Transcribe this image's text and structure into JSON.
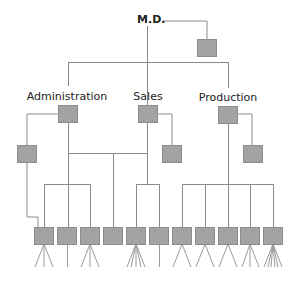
{
  "diagram": {
    "title_node": {
      "label": "M.D."
    },
    "departments": [
      {
        "label": "Administration"
      },
      {
        "label": "Sales"
      },
      {
        "label": "Production"
      }
    ],
    "colors": {
      "box_fill": "#a3a3a3",
      "box_border": "#8c8c8c",
      "line": "#8a8a8a",
      "text": "#222222"
    },
    "bottom_units_count": 11,
    "fan_counts": [
      3,
      1,
      3,
      0,
      5,
      1,
      3,
      3,
      3,
      3,
      6
    ]
  }
}
